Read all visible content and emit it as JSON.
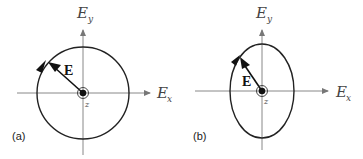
{
  "figure": {
    "panels": [
      {
        "id": "a",
        "label": "(a)",
        "shape": "circle",
        "description": "Circular polarization",
        "axes": {
          "x_label": "E",
          "x_sub": "x",
          "y_label": "E",
          "y_sub": "y"
        },
        "vector_label": "E",
        "origin_label": "z"
      },
      {
        "id": "b",
        "label": "(b)",
        "shape": "ellipse",
        "description": "Elliptical polarization",
        "axes": {
          "x_label": "E",
          "x_sub": "x",
          "y_label": "E",
          "y_sub": "y"
        },
        "vector_label": "E",
        "origin_label": "z"
      }
    ],
    "colors": {
      "axis": "#888888",
      "curve": "#222222",
      "vector": "#111111"
    }
  }
}
